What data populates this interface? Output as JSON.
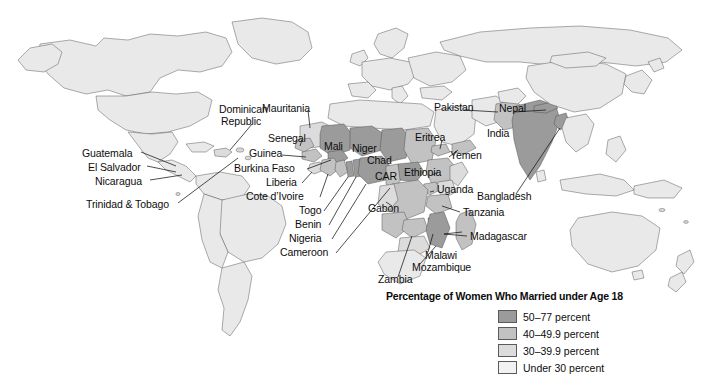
{
  "figure": {
    "type": "choropleth-world-map",
    "name": "world-map-child-marriage"
  },
  "legend": {
    "title": "Percentage of Women Who Married under Age 18",
    "entries": [
      {
        "label": "50–77 percent",
        "color": "#9b9b9b"
      },
      {
        "label": "40–49.9 percent",
        "color": "#c2c2c2"
      },
      {
        "label": "30–39.9 percent",
        "color": "#dcdcdc"
      },
      {
        "label": "Under 30 percent",
        "color": "#f2f2f2"
      }
    ]
  },
  "map_colors": {
    "base_land": "#e9e9e9",
    "outline": "#4a4a4a",
    "background": "#ffffff",
    "class_50_77": "#9b9b9b",
    "class_40_49": "#c2c2c2",
    "class_30_39": "#dcdcdc",
    "class_under_30": "#f2f2f2"
  },
  "labels": {
    "americas": [
      {
        "text": "Dominican",
        "x": 219,
        "y": 110
      },
      {
        "text": "Republic",
        "x": 221,
        "y": 122
      },
      {
        "text": "Guatemala",
        "x": 82,
        "y": 153
      },
      {
        "text": "El Salvador",
        "x": 88,
        "y": 167
      },
      {
        "text": "Nicaragua",
        "x": 95,
        "y": 181
      },
      {
        "text": "Trinidad & Tobago",
        "x": 86,
        "y": 204
      }
    ],
    "west_africa": [
      {
        "text": "Mauritania",
        "x": 262,
        "y": 108
      },
      {
        "text": "Senegal",
        "x": 268,
        "y": 138
      },
      {
        "text": "Guinea",
        "x": 249,
        "y": 153
      },
      {
        "text": "Burkina Faso",
        "x": 241,
        "y": 168
      },
      {
        "text": "Liberia",
        "x": 271,
        "y": 182
      },
      {
        "text": "Cote d’Ivoire",
        "x": 264,
        "y": 196
      },
      {
        "text": "Togo",
        "x": 303,
        "y": 210
      },
      {
        "text": "Benin",
        "x": 299,
        "y": 224
      },
      {
        "text": "Nigeria",
        "x": 293,
        "y": 238
      },
      {
        "text": "Cameroon",
        "x": 283,
        "y": 252
      }
    ],
    "central_east_africa": [
      {
        "text": "Mali",
        "x": 327,
        "y": 146
      },
      {
        "text": "Niger",
        "x": 355,
        "y": 148
      },
      {
        "text": "Chad",
        "x": 369,
        "y": 160
      },
      {
        "text": "CAR",
        "x": 377,
        "y": 176
      },
      {
        "text": "Gabon",
        "x": 372,
        "y": 208
      },
      {
        "text": "Ethiopia",
        "x": 408,
        "y": 172
      },
      {
        "text": "Uganda",
        "x": 437,
        "y": 189
      },
      {
        "text": "Tanzania",
        "x": 463,
        "y": 213
      },
      {
        "text": "Madagascar",
        "x": 470,
        "y": 237
      },
      {
        "text": "Malawi",
        "x": 425,
        "y": 255
      },
      {
        "text": "Mozambique",
        "x": 415,
        "y": 267
      },
      {
        "text": "Zambia",
        "x": 381,
        "y": 279
      }
    ],
    "asia": [
      {
        "text": "Pakistan",
        "x": 437,
        "y": 107
      },
      {
        "text": "Nepal",
        "x": 502,
        "y": 108
      },
      {
        "text": "India",
        "x": 490,
        "y": 133
      },
      {
        "text": "Eritrea",
        "x": 418,
        "y": 137
      },
      {
        "text": "Yemen",
        "x": 452,
        "y": 155
      },
      {
        "text": "Bangladesh",
        "x": 480,
        "y": 196
      }
    ]
  }
}
